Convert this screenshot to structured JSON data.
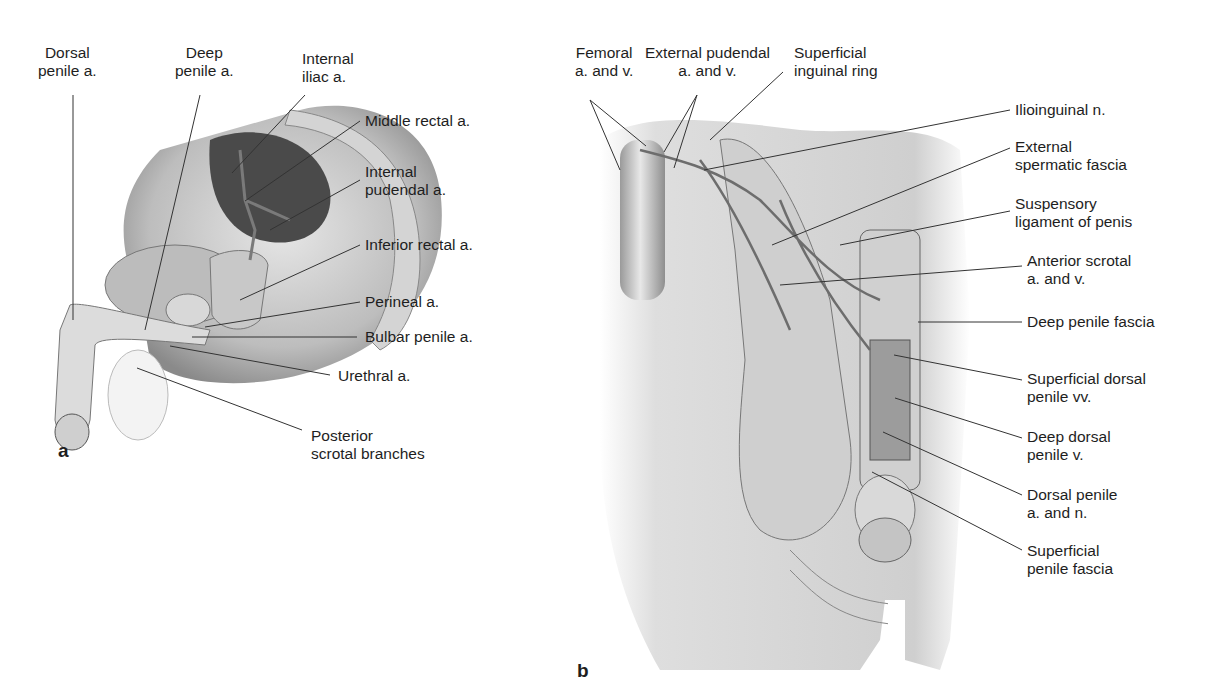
{
  "figure": {
    "panel_a": {
      "letter": "a",
      "labels": {
        "dorsal_penile_a": "Dorsal\npenile a.",
        "deep_penile_a": "Deep\npenile a.",
        "internal_iliac_a": "Internal\niliac a.",
        "middle_rectal_a": "Middle rectal a.",
        "internal_pudendal_a": "Internal\npudendal a.",
        "inferior_rectal_a": "Inferior rectal a.",
        "perineal_a": "Perineal a.",
        "bulbar_penile_a": "Bulbar penile a.",
        "urethral_a": "Urethral a.",
        "posterior_scrotal_branches": "Posterior\nscrotal branches"
      }
    },
    "panel_b": {
      "letter": "b",
      "labels": {
        "femoral_a_v": "Femoral\na. and v.",
        "external_pudendal_a_v": "External pudendal\na. and v.",
        "superficial_inguinal_ring": "Superficial\ninguinal ring",
        "ilioinguinal_n": "Ilioinguinal n.",
        "external_spermatic_fascia": "External\nspermatic fascia",
        "suspensory_ligament": "Suspensory\nligament of penis",
        "anterior_scrotal_a_v": "Anterior scrotal\na. and v.",
        "deep_penile_fascia": "Deep penile fascia",
        "superficial_dorsal_penile_vv": "Superficial dorsal\npenile vv.",
        "deep_dorsal_penile_v": "Deep dorsal\npenile v.",
        "dorsal_penile_a_n": "Dorsal penile\na. and n.",
        "superficial_penile_fascia": "Superficial\npenile fascia"
      }
    }
  }
}
